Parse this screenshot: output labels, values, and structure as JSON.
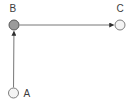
{
  "diagram": {
    "title": "",
    "background_color": "#ffffff",
    "edge_color": "#767676",
    "arrow_color": "#2e2e2e",
    "label_color": "#3c3c3c",
    "nodes": [
      {
        "id": "A",
        "label": "A",
        "x": 13.5,
        "y": 93,
        "r": 5,
        "fill": "#f4f4f4",
        "stroke": "#7e7e7e",
        "label_x": 23.5,
        "label_y": 96.5
      },
      {
        "id": "B",
        "label": "B",
        "x": 14,
        "y": 25,
        "r": 5,
        "fill": "#9b9b9b",
        "stroke": "#595959",
        "label_x": 9.5,
        "label_y": 12
      },
      {
        "id": "C",
        "label": "C",
        "x": 120,
        "y": 25,
        "r": 5,
        "fill": "#f4f4f4",
        "stroke": "#7e7e7e",
        "label_x": 116.5,
        "label_y": 12
      }
    ],
    "edges": [
      {
        "from": "A",
        "to": "B",
        "directed": true
      },
      {
        "from": "B",
        "to": "C",
        "directed": true
      }
    ]
  }
}
